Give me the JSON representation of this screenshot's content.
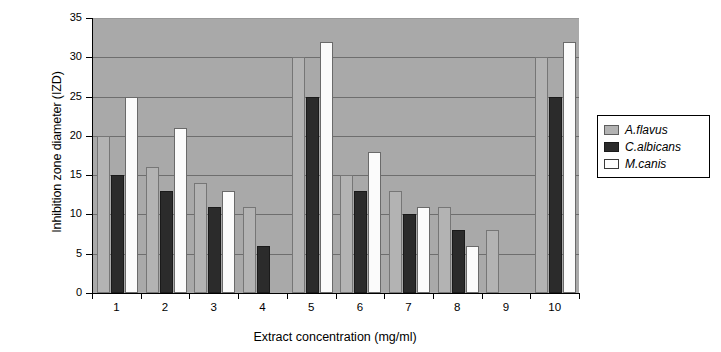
{
  "chart_data": {
    "type": "bar",
    "title": "",
    "xlabel": "Extract concentration (mg/ml)",
    "ylabel": "Inhibition zone diameter (IZD)",
    "categories": [
      "1",
      "2",
      "3",
      "4",
      "5",
      "6",
      "7",
      "8",
      "9",
      "10"
    ],
    "series": [
      {
        "name": "A.flavus",
        "color": "#b3b3b3",
        "values": [
          20,
          16,
          14,
          11,
          30,
          15,
          13,
          11,
          8,
          30
        ]
      },
      {
        "name": "C.albicans",
        "color": "#2b2b2b",
        "values": [
          15,
          13,
          11,
          6,
          25,
          13,
          10,
          8,
          0,
          25
        ]
      },
      {
        "name": "M.canis",
        "color": "#ffffff",
        "values": [
          25,
          21,
          13,
          0,
          32,
          18,
          11,
          6,
          0,
          32
        ]
      }
    ],
    "ylim": [
      0,
      35
    ],
    "yticks": [
      0,
      5,
      10,
      15,
      20,
      25,
      30,
      35
    ],
    "ytick_labels": [
      "0",
      "5",
      "10",
      "15",
      "20",
      "25",
      "30",
      "35"
    ],
    "grid": true,
    "legend_position": "right",
    "plot_background": "#a9a9a9",
    "figure_background": "#ffffff"
  },
  "legend": {
    "items": [
      {
        "label": "A.flavus"
      },
      {
        "label": "C.albicans"
      },
      {
        "label": "M.canis"
      }
    ]
  }
}
